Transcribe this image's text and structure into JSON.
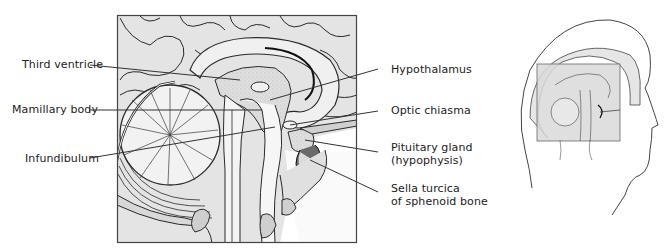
{
  "figure": {
    "type": "anatomical-illustration",
    "colors": {
      "background": "#ffffff",
      "tissue_fill": "#e2e2e2",
      "tissue_light": "#ececec",
      "stipple": "#cfcfcf",
      "outline": "#2a2a2a",
      "leader_line": "#333333",
      "frame": "#444444",
      "inset_highlight": "#d8d8d8"
    },
    "labels_left": [
      {
        "id": "third-ventricle",
        "text": "Third ventricle"
      },
      {
        "id": "mamillary-body",
        "text": "Mamillary body"
      },
      {
        "id": "infundibulum",
        "text": "Infundibulum"
      }
    ],
    "labels_right": [
      {
        "id": "hypothalamus",
        "text": "Hypothalamus"
      },
      {
        "id": "optic-chiasma",
        "text": "Optic chiasma"
      },
      {
        "id": "pituitary-gland",
        "line1": "Pituitary gland",
        "line2": "(hypophysis)"
      },
      {
        "id": "sella-turcica",
        "line1": "Sella turcica",
        "line2": "of sphenoid bone"
      }
    ],
    "inset": {
      "description": "Head profile with shaded box indicating enlarged region"
    }
  }
}
